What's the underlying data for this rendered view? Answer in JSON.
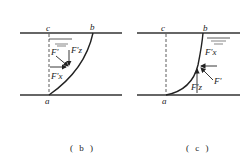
{
  "panels": [
    {
      "id": "b",
      "caption": "( b )",
      "points": {
        "a": "a",
        "b": "b",
        "c": "c"
      },
      "forces": {
        "F": "F'",
        "Fz": "F'z",
        "Fx": "F'x"
      }
    },
    {
      "id": "c",
      "caption": "( c )",
      "points": {
        "a": "a",
        "b": "b",
        "c": "c"
      },
      "forces": {
        "F": "F'",
        "Fz": "F'z",
        "Fx": "F'x"
      }
    }
  ]
}
